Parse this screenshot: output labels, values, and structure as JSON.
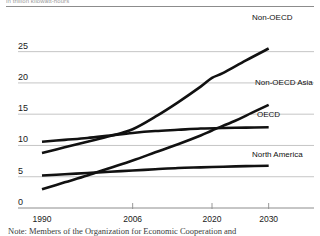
{
  "figure": {
    "clipped_title": "in trillion kilowatt-hours",
    "note": "Note: Members of the Organization for Economic Cooperation and"
  },
  "chart_data": {
    "type": "line",
    "title": "",
    "subtitle": "",
    "xlabel": "",
    "ylabel": "",
    "xlim": [
      1990,
      2032
    ],
    "ylim": [
      0,
      27.5
    ],
    "yticks": [
      0,
      5,
      10,
      15,
      20,
      25
    ],
    "ytick_labels": [
      "0",
      "5",
      "10",
      "15",
      "20",
      "25"
    ],
    "xticks": [
      1990,
      2006,
      2020,
      2030
    ],
    "xtick_labels": [
      "1990",
      "2006",
      "2020",
      "2030"
    ],
    "grid": "horizontal",
    "legend_position": "right-inline",
    "line_color": "#111111",
    "grid_color": "#b8b8b8",
    "axis_color": "#8c8c8c",
    "series": [
      {
        "name": "Non-OECD",
        "label": "Non-OECD",
        "x": [
          1990,
          1994,
          1998,
          2002,
          2006,
          2010,
          2014,
          2018,
          2020,
          2022,
          2026,
          2030
        ],
        "values": [
          8.8,
          9.7,
          10.6,
          11.5,
          12.6,
          14.6,
          16.9,
          19.4,
          20.8,
          21.6,
          23.6,
          25.5
        ]
      },
      {
        "name": "OECD",
        "label": "OECD",
        "x": [
          1990,
          1994,
          1998,
          2002,
          2006,
          2010,
          2014,
          2018,
          2022,
          2026,
          2030
        ],
        "values": [
          10.6,
          10.9,
          11.2,
          11.6,
          12.0,
          12.3,
          12.5,
          12.7,
          12.8,
          12.85,
          12.9
        ]
      },
      {
        "name": "Non-OECD Asia",
        "label": "Non-OECD Asia",
        "x": [
          1990,
          1994,
          1998,
          2002,
          2006,
          2010,
          2014,
          2018,
          2020,
          2024,
          2027,
          2030
        ],
        "values": [
          3.0,
          4.1,
          5.2,
          6.4,
          7.6,
          8.9,
          10.2,
          11.6,
          12.4,
          13.9,
          15.2,
          16.5
        ]
      },
      {
        "name": "North America",
        "label": "North America",
        "x": [
          1990,
          1994,
          1998,
          2002,
          2006,
          2010,
          2014,
          2018,
          2022,
          2026,
          2030
        ],
        "values": [
          5.2,
          5.4,
          5.6,
          5.8,
          6.0,
          6.2,
          6.4,
          6.5,
          6.6,
          6.7,
          6.75
        ]
      }
    ],
    "annotations": [
      {
        "text": "Non-OECD",
        "x_px": 252,
        "y_px": 13
      },
      {
        "text": "Non-OECD Asia",
        "x_px": 255,
        "y_px": 78
      },
      {
        "text": "OECD",
        "x_px": 257,
        "y_px": 110
      },
      {
        "text": "North America",
        "x_px": 252,
        "y_px": 150
      }
    ]
  }
}
